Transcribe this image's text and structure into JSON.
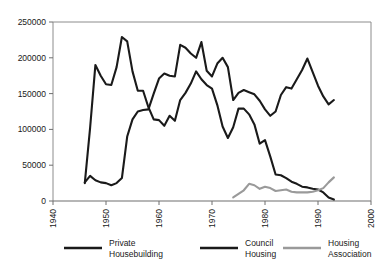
{
  "chart_data": {
    "type": "line",
    "title": "",
    "xlabel": "",
    "ylabel": "",
    "xlim": [
      1940,
      2000
    ],
    "ylim": [
      0,
      250000
    ],
    "xticks": [
      1940,
      1950,
      1960,
      1970,
      1980,
      1990,
      2000
    ],
    "yticks": [
      0,
      50000,
      100000,
      150000,
      200000,
      250000
    ],
    "xtick_labels": [
      "1940",
      "1950",
      "1960",
      "1970",
      "1980",
      "1990",
      "2000"
    ],
    "ytick_labels": [
      "0",
      "50000",
      "100000",
      "150000",
      "200000",
      "250000"
    ],
    "grid": false,
    "legend_position": "bottom",
    "series": [
      {
        "name": "Private Housebuilding",
        "color": "#1a1a1a",
        "width": 2.1,
        "x": [
          1946,
          1947,
          1948,
          1949,
          1950,
          1951,
          1952,
          1953,
          1954,
          1955,
          1956,
          1957,
          1958,
          1959,
          1960,
          1961,
          1962,
          1963,
          1964,
          1965,
          1966,
          1967,
          1968,
          1969,
          1970,
          1971,
          1972,
          1973,
          1974,
          1975,
          1976,
          1977,
          1978,
          1979,
          1980,
          1981,
          1982,
          1983,
          1984,
          1985,
          1986,
          1987,
          1988,
          1989,
          1990,
          1991,
          1992,
          1993
        ],
        "y": [
          26000,
          35000,
          29000,
          26000,
          25000,
          22000,
          25000,
          32000,
          90000,
          114000,
          125000,
          127000,
          128000,
          150000,
          171000,
          178000,
          175000,
          174000,
          218000,
          214000,
          206000,
          200000,
          222000,
          182000,
          174000,
          192000,
          200000,
          187000,
          141000,
          151000,
          155000,
          152000,
          149000,
          140000,
          128000,
          119000,
          125000,
          148000,
          159000,
          157000,
          170000,
          183000,
          199000,
          180000,
          161000,
          146000,
          135000,
          141000
        ]
      },
      {
        "name": "Council Housing",
        "color": "#1a1a1a",
        "width": 2.1,
        "x": [
          1946,
          1947,
          1948,
          1949,
          1950,
          1951,
          1952,
          1953,
          1954,
          1955,
          1956,
          1957,
          1958,
          1959,
          1960,
          1961,
          1962,
          1963,
          1964,
          1965,
          1966,
          1967,
          1968,
          1969,
          1970,
          1971,
          1972,
          1973,
          1974,
          1975,
          1976,
          1977,
          1978,
          1979,
          1980,
          1981,
          1982,
          1983,
          1984,
          1985,
          1986,
          1987,
          1988,
          1989,
          1990,
          1991,
          1992,
          1993
        ],
        "y": [
          25000,
          102000,
          190000,
          175000,
          163000,
          162000,
          187000,
          229000,
          223000,
          181000,
          154000,
          154000,
          131000,
          114000,
          113000,
          105000,
          119000,
          112000,
          141000,
          151000,
          164000,
          181000,
          170000,
          162000,
          157000,
          134000,
          104000,
          88000,
          103000,
          129000,
          129000,
          121000,
          107000,
          80000,
          85000,
          62000,
          37000,
          36000,
          32000,
          27000,
          24000,
          20000,
          19000,
          17000,
          16000,
          12000,
          5000,
          2000
        ]
      },
      {
        "name": "Housing Association",
        "color": "#9a9a9a",
        "width": 2.1,
        "x": [
          1974,
          1975,
          1976,
          1977,
          1978,
          1979,
          1980,
          1981,
          1982,
          1983,
          1984,
          1985,
          1986,
          1987,
          1988,
          1989,
          1990,
          1991,
          1992,
          1993
        ],
        "y": [
          5000,
          10000,
          15000,
          24000,
          22000,
          17000,
          20000,
          18000,
          14000,
          15000,
          16000,
          13000,
          12000,
          12000,
          12000,
          13000,
          15000,
          18000,
          26000,
          33000
        ]
      }
    ],
    "legend": [
      {
        "label_line1": "Private",
        "label_line2": "Housebuilding",
        "color": "#1a1a1a"
      },
      {
        "label_line1": "Council",
        "label_line2": "Housing",
        "color": "#1a1a1a"
      },
      {
        "label_line1": "Housing",
        "label_line2": "Association",
        "color": "#9a9a9a"
      }
    ],
    "axis_color": "#6e6e6e",
    "frame_color": "#8c8c8c"
  }
}
